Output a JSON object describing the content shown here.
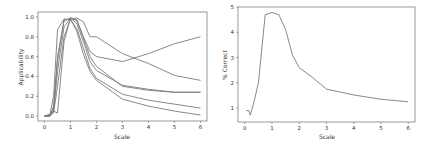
{
  "chart_data": [
    {
      "type": "line",
      "title": "",
      "xlabel": "Scale",
      "ylabel": "Applicability",
      "xlim": [
        -0.25,
        6.25
      ],
      "ylim": [
        -0.05,
        1.05
      ],
      "xticks": [
        0,
        1,
        2,
        3,
        4,
        5,
        6
      ],
      "yticks": [
        0.0,
        0.2,
        0.4,
        0.6,
        0.8,
        1.0
      ],
      "ytick_labels": [
        "0.0",
        "0.2",
        "0.4",
        "0.6",
        "0.8",
        "1.0"
      ],
      "grid": false,
      "legend": null,
      "line_color": "#7a7a7a",
      "series": [
        {
          "name": "series-1",
          "x": [
            0,
            0.2,
            0.35,
            0.5,
            0.75,
            1.0,
            1.25,
            1.5,
            1.75,
            2,
            3,
            4,
            5,
            6
          ],
          "y": [
            0,
            0,
            0.05,
            0.45,
            0.9,
            0.99,
            0.96,
            0.8,
            0.65,
            0.6,
            0.55,
            0.63,
            0.73,
            0.8
          ]
        },
        {
          "name": "series-2",
          "x": [
            0,
            0.2,
            0.35,
            0.5,
            0.75,
            1.0,
            1.25,
            1.5,
            1.75,
            2,
            3,
            4,
            5,
            6
          ],
          "y": [
            0,
            0,
            0.03,
            0.3,
            0.8,
            0.98,
            0.99,
            0.95,
            0.8,
            0.8,
            0.63,
            0.53,
            0.41,
            0.36
          ]
        },
        {
          "name": "series-3",
          "x": [
            0,
            0.2,
            0.35,
            0.5,
            0.75,
            1.0,
            1.25,
            1.5,
            1.75,
            2,
            3,
            4,
            5,
            6
          ],
          "y": [
            0,
            0,
            0.1,
            0.6,
            0.96,
            0.99,
            0.93,
            0.75,
            0.55,
            0.46,
            0.31,
            0.27,
            0.24,
            0.24
          ]
        },
        {
          "name": "series-4",
          "x": [
            0,
            0.2,
            0.35,
            0.5,
            0.75,
            1.0,
            1.25,
            1.5,
            1.75,
            2,
            3,
            4,
            5,
            6
          ],
          "y": [
            0,
            0,
            0.2,
            0.87,
            0.98,
            0.97,
            0.88,
            0.68,
            0.48,
            0.38,
            0.22,
            0.16,
            0.12,
            0.08
          ]
        },
        {
          "name": "series-5",
          "x": [
            0,
            0.2,
            0.35,
            0.5,
            0.75,
            1.0,
            1.25,
            1.5,
            1.75,
            2,
            3,
            4,
            5,
            6
          ],
          "y": [
            0,
            0,
            0.08,
            0.55,
            0.97,
            0.98,
            0.85,
            0.62,
            0.45,
            0.36,
            0.17,
            0.1,
            0.05,
            0.01
          ]
        },
        {
          "name": "series-6",
          "x": [
            0,
            0.2,
            0.35,
            0.5,
            0.75,
            1.0,
            1.25,
            1.5,
            1.75,
            2,
            3,
            4,
            5,
            6
          ],
          "y": [
            0,
            0.02,
            0.05,
            0.03,
            0.75,
            0.99,
            0.97,
            0.78,
            0.6,
            0.5,
            0.3,
            0.26,
            0.24,
            0.24
          ]
        }
      ]
    },
    {
      "type": "line",
      "title": "",
      "xlabel": "Scale",
      "ylabel": "% Correct",
      "xlim": [
        -0.25,
        6.25
      ],
      "ylim": [
        0.45,
        5.0
      ],
      "xticks": [
        0,
        1,
        2,
        3,
        4,
        5,
        6
      ],
      "yticks": [
        1,
        2,
        3,
        4,
        5
      ],
      "ytick_labels": [
        "1",
        "2",
        "3",
        "4",
        "5"
      ],
      "grid": false,
      "legend": null,
      "line_color": "#7a7a7a",
      "series": [
        {
          "name": "% Correct",
          "x": [
            0.05,
            0.15,
            0.2,
            0.35,
            0.5,
            0.75,
            1.0,
            1.25,
            1.5,
            1.75,
            2,
            2.5,
            3,
            4,
            5,
            6
          ],
          "y": [
            0.9,
            0.9,
            0.72,
            1.3,
            2.0,
            4.7,
            4.78,
            4.7,
            4.1,
            3.1,
            2.6,
            2.2,
            1.75,
            1.52,
            1.35,
            1.25
          ]
        }
      ]
    }
  ],
  "charts": [
    {
      "xlabel": "Scale",
      "ylabel": "Applicability"
    },
    {
      "xlabel": "Scale",
      "ylabel": "% Correct"
    }
  ]
}
